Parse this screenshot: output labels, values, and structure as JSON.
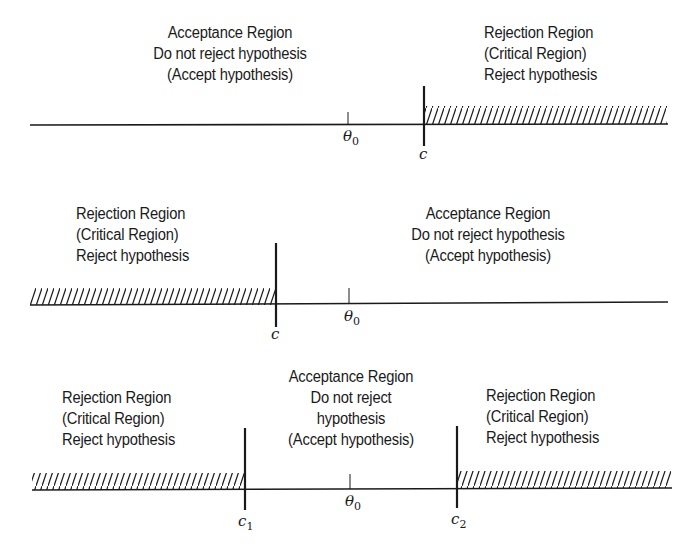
{
  "panels": [
    {
      "id": "upper-tail",
      "regions": {
        "acceptance": [
          "Acceptance Region",
          "Do not reject hypothesis",
          "(Accept hypothesis)"
        ],
        "rejection_right": [
          "Rejection Region",
          "(Critical Region)",
          "Reject hypothesis"
        ]
      },
      "symbols": {
        "theta": "θ",
        "theta_sub": "0",
        "critical": "c"
      }
    },
    {
      "id": "lower-tail",
      "regions": {
        "rejection_left": [
          "Rejection Region",
          "(Critical Region)",
          "Reject hypothesis"
        ],
        "acceptance": [
          "Acceptance Region",
          "Do not reject hypothesis",
          "(Accept hypothesis)"
        ]
      },
      "symbols": {
        "theta": "θ",
        "theta_sub": "0",
        "critical": "c"
      }
    },
    {
      "id": "two-tail",
      "regions": {
        "rejection_left": [
          "Rejection Region",
          "(Critical Region)",
          "Reject hypothesis"
        ],
        "acceptance": [
          "Acceptance Region",
          "Do not reject",
          "hypothesis",
          "(Accept hypothesis)"
        ],
        "rejection_right": [
          "Rejection Region",
          "(Critical Region)",
          "Reject hypothesis"
        ]
      },
      "symbols": {
        "theta": "θ",
        "theta_sub": "0",
        "critical_1": "c",
        "critical_1_sub": "1",
        "critical_2": "c",
        "critical_2_sub": "2"
      }
    }
  ],
  "style": {
    "ink": "#1a1a1a",
    "background": "#ffffff"
  }
}
